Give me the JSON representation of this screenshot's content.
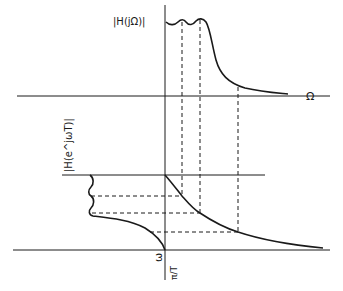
{
  "diagram": {
    "labels": {
      "analog_magnitude": "|H(jΩ)|",
      "analog_freq_axis": "Ω",
      "digital_magnitude": "|H(e^jωT)|",
      "digital_freq_axis": "ω",
      "nyquist": "π/T"
    },
    "colors": {
      "ink": "#1a1a1a",
      "background": "#ffffff"
    }
  }
}
